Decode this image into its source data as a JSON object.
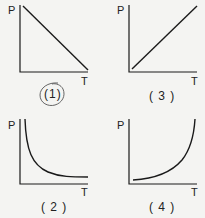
{
  "colors": {
    "background": "#f4f4f2",
    "ink": "#1a1a1a",
    "annotation": "#555555"
  },
  "graphs": [
    {
      "id": "1",
      "caption": "(1)",
      "y_label": "P",
      "x_label": "T",
      "shape": "straight line decreasing",
      "circled": true
    },
    {
      "id": "3",
      "caption": "( 3 )",
      "y_label": "P",
      "x_label": "T",
      "shape": "straight line increasing from origin"
    },
    {
      "id": "2",
      "caption": "( 2 )",
      "y_label": "P",
      "x_label": "T",
      "shape": "hyperbolic decreasing curve"
    },
    {
      "id": "4",
      "caption": "( 4 )",
      "y_label": "P",
      "x_label": "T",
      "shape": "exponential increasing curve"
    }
  ]
}
